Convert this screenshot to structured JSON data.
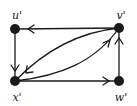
{
  "diagram": {
    "type": "directed-graph",
    "nodes": [
      {
        "id": "u",
        "label": "u'",
        "x": 15,
        "y": 29
      },
      {
        "id": "v",
        "label": "v'",
        "x": 119,
        "y": 28
      },
      {
        "id": "x",
        "label": "x'",
        "x": 15,
        "y": 81
      },
      {
        "id": "w",
        "label": "w'",
        "x": 119,
        "y": 81
      }
    ],
    "edges": [
      {
        "from": "v",
        "to": "u",
        "shape": "straight"
      },
      {
        "from": "u",
        "to": "x",
        "shape": "straight"
      },
      {
        "from": "x",
        "to": "w",
        "shape": "straight"
      },
      {
        "from": "w",
        "to": "v",
        "shape": "straight"
      },
      {
        "from": "v",
        "to": "x",
        "shape": "curved-upper"
      },
      {
        "from": "x",
        "to": "v",
        "shape": "curved-lower"
      }
    ],
    "colors": {
      "ink": "#1a1a1a",
      "background": "#ffffff"
    }
  }
}
